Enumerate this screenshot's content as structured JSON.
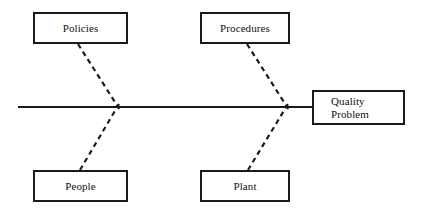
{
  "diagram": {
    "type": "fishbone-ishikawa-cause-and-effect",
    "spine": {
      "label": "spine",
      "x_start": 18,
      "x_end": 312,
      "y": 107,
      "stroke": "#1a1a1a",
      "stroke_width": 2,
      "style": "solid"
    },
    "effect": {
      "label": "Quality\nProblem",
      "line1": "Quality",
      "line2": "Problem",
      "x": 312,
      "y": 90,
      "width": 93,
      "height": 35
    },
    "categories": [
      {
        "id": "policies",
        "label": "Policies",
        "position": "top-left",
        "x": 33,
        "y": 12,
        "width": 95,
        "height": 32,
        "rib": {
          "from_x": 78,
          "from_y": 44,
          "to_x": 118,
          "to_y": 107,
          "style": "dashed"
        }
      },
      {
        "id": "procedures",
        "label": "Procedures",
        "position": "top-right",
        "x": 200,
        "y": 12,
        "width": 90,
        "height": 32,
        "rib": {
          "from_x": 247,
          "from_y": 44,
          "to_x": 287,
          "to_y": 107,
          "style": "dashed"
        }
      },
      {
        "id": "people",
        "label": "People",
        "position": "bottom-left",
        "x": 33,
        "y": 170,
        "width": 95,
        "height": 32,
        "rib": {
          "from_x": 80,
          "from_y": 170,
          "to_x": 118,
          "to_y": 107,
          "style": "dashed"
        }
      },
      {
        "id": "plant",
        "label": "Plant",
        "position": "bottom-right",
        "x": 200,
        "y": 170,
        "width": 90,
        "height": 32,
        "rib": {
          "from_x": 248,
          "from_y": 170,
          "to_x": 287,
          "to_y": 107,
          "style": "dashed"
        }
      }
    ],
    "colors": {
      "line": "#1a1a1a",
      "box_border": "#1a1a1a",
      "box_fill": "#ffffff",
      "text": "#111111",
      "background": "#ffffff"
    }
  }
}
